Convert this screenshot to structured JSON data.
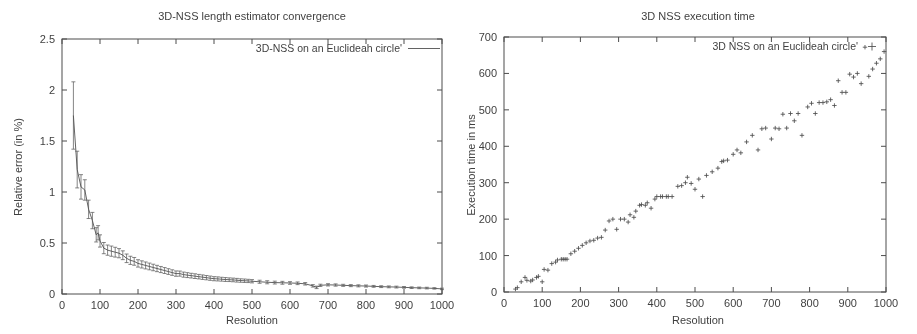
{
  "figure": {
    "background_color": "#ffffff",
    "ink_color": "#3c3c3c"
  },
  "panels": [
    {
      "name": "convergence",
      "title": "3D-NSS length estimator convergence",
      "xlabel": "Resolution",
      "ylabel": "Relative error (in %)",
      "legend_label": "3D-NSS on an Euclideah circle'",
      "legend_marker": "line"
    },
    {
      "name": "execution-time",
      "title": "3D NSS execution time",
      "xlabel": "Resolution",
      "ylabel": "Execution time in ms",
      "legend_label": "3D NSS on an Euclideah circle'",
      "legend_marker": "plus"
    }
  ],
  "chart_data": [
    {
      "type": "line",
      "title": "3D-NSS length estimator convergence",
      "xlabel": "Resolution",
      "ylabel": "Relative error (in %)",
      "xlim": [
        0,
        1000
      ],
      "ylim": [
        0,
        2.5
      ],
      "xticks": [
        0,
        100,
        200,
        300,
        400,
        500,
        600,
        700,
        800,
        900,
        1000
      ],
      "yticks": [
        0,
        0.5,
        1,
        1.5,
        2,
        2.5
      ],
      "grid": false,
      "legend": [
        "3D-NSS on an Euclideah circle'"
      ],
      "legend_position": "top-right",
      "error_bars": true,
      "series": [
        {
          "name": "3D-NSS on an Euclideah circle'",
          "x": [
            30,
            40,
            50,
            60,
            70,
            80,
            90,
            95,
            100,
            110,
            120,
            130,
            140,
            150,
            160,
            170,
            180,
            190,
            200,
            210,
            220,
            230,
            240,
            250,
            260,
            270,
            280,
            290,
            300,
            310,
            320,
            330,
            340,
            350,
            360,
            370,
            380,
            390,
            400,
            410,
            420,
            430,
            440,
            450,
            460,
            470,
            480,
            490,
            500,
            520,
            540,
            560,
            580,
            600,
            620,
            640,
            660,
            670,
            680,
            700,
            720,
            740,
            760,
            780,
            800,
            820,
            840,
            860,
            880,
            900,
            920,
            940,
            960,
            980,
            1000
          ],
          "y": [
            1.75,
            1.22,
            1.05,
            1.02,
            0.83,
            0.72,
            0.58,
            0.6,
            0.52,
            0.45,
            0.43,
            0.42,
            0.41,
            0.4,
            0.38,
            0.35,
            0.33,
            0.32,
            0.3,
            0.29,
            0.28,
            0.27,
            0.26,
            0.25,
            0.24,
            0.23,
            0.22,
            0.21,
            0.2,
            0.2,
            0.19,
            0.185,
            0.18,
            0.175,
            0.17,
            0.165,
            0.16,
            0.155,
            0.15,
            0.148,
            0.145,
            0.142,
            0.14,
            0.138,
            0.135,
            0.132,
            0.13,
            0.128,
            0.125,
            0.12,
            0.115,
            0.112,
            0.11,
            0.108,
            0.105,
            0.1,
            0.08,
            0.065,
            0.085,
            0.09,
            0.088,
            0.085,
            0.082,
            0.08,
            0.078,
            0.075,
            0.072,
            0.07,
            0.068,
            0.065,
            0.062,
            0.06,
            0.058,
            0.055,
            0.05
          ],
          "yerr": [
            0.33,
            0.18,
            0.12,
            0.1,
            0.09,
            0.08,
            0.07,
            0.07,
            0.06,
            0.055,
            0.05,
            0.05,
            0.048,
            0.045,
            0.043,
            0.042,
            0.04,
            0.038,
            0.036,
            0.035,
            0.034,
            0.033,
            0.032,
            0.031,
            0.03,
            0.029,
            0.028,
            0.027,
            0.026,
            0.025,
            0.025,
            0.024,
            0.023,
            0.023,
            0.022,
            0.022,
            0.021,
            0.021,
            0.02,
            0.02,
            0.019,
            0.019,
            0.018,
            0.018,
            0.018,
            0.017,
            0.017,
            0.016,
            0.016,
            0.015,
            0.015,
            0.014,
            0.014,
            0.013,
            0.013,
            0.012,
            0.012,
            0.012,
            0.011,
            0.011,
            0.011,
            0.01,
            0.01,
            0.01,
            0.01,
            0.009,
            0.009,
            0.009,
            0.009,
            0.008,
            0.008,
            0.008,
            0.008,
            0.007,
            0.007
          ]
        }
      ]
    },
    {
      "type": "scatter",
      "title": "3D NSS execution time",
      "xlabel": "Resolution",
      "ylabel": "Execution time in ms",
      "xlim": [
        0,
        1000
      ],
      "ylim": [
        0,
        700
      ],
      "xticks": [
        0,
        100,
        200,
        300,
        400,
        500,
        600,
        700,
        800,
        900,
        1000
      ],
      "yticks": [
        0,
        100,
        200,
        300,
        400,
        500,
        600,
        700
      ],
      "grid": false,
      "legend": [
        "3D NSS on an Euclideah circle'"
      ],
      "legend_position": "top-right",
      "marker": "+",
      "series": [
        {
          "name": "3D NSS on an Euclideah circle'",
          "x": [
            30,
            35,
            45,
            55,
            60,
            70,
            75,
            85,
            90,
            100,
            105,
            115,
            125,
            135,
            140,
            150,
            155,
            160,
            165,
            175,
            185,
            195,
            205,
            215,
            225,
            235,
            245,
            255,
            265,
            275,
            285,
            295,
            305,
            315,
            325,
            330,
            340,
            345,
            355,
            360,
            370,
            375,
            385,
            395,
            400,
            410,
            415,
            425,
            430,
            440,
            455,
            465,
            475,
            480,
            490,
            500,
            510,
            520,
            530,
            545,
            560,
            570,
            575,
            585,
            600,
            610,
            620,
            635,
            650,
            665,
            675,
            685,
            700,
            710,
            720,
            730,
            740,
            750,
            760,
            770,
            780,
            795,
            805,
            815,
            825,
            835,
            845,
            855,
            865,
            875,
            885,
            895,
            905,
            915,
            925,
            935,
            945,
            955,
            965,
            975,
            985,
            995
          ],
          "y": [
            8,
            12,
            28,
            40,
            32,
            30,
            33,
            40,
            43,
            28,
            62,
            60,
            78,
            82,
            88,
            90,
            90,
            90,
            90,
            105,
            112,
            120,
            128,
            135,
            140,
            142,
            148,
            150,
            170,
            195,
            200,
            172,
            200,
            200,
            192,
            212,
            205,
            222,
            238,
            240,
            238,
            245,
            230,
            255,
            262,
            262,
            262,
            262,
            262,
            262,
            290,
            292,
            300,
            315,
            298,
            282,
            310,
            262,
            320,
            330,
            340,
            358,
            360,
            362,
            378,
            390,
            382,
            412,
            430,
            390,
            448,
            450,
            420,
            450,
            448,
            488,
            450,
            490,
            470,
            490,
            430,
            508,
            518,
            490,
            520,
            520,
            522,
            528,
            512,
            580,
            548,
            548,
            598,
            590,
            600,
            572,
            672,
            592,
            612,
            628,
            640,
            660
          ]
        }
      ]
    }
  ]
}
